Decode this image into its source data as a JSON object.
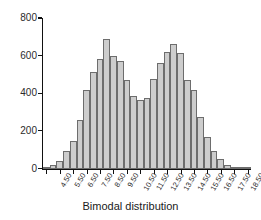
{
  "chart_data": {
    "type": "bar",
    "title": "",
    "xlabel": "Bimodal distribution",
    "ylabel": "",
    "grid": false,
    "legend": null,
    "ylim": [
      0,
      800
    ],
    "yticks": [
      0,
      200,
      400,
      600,
      800
    ],
    "ytick_labels": [
      "0",
      "200",
      "400",
      "600",
      "800"
    ],
    "categories": [
      "4.50",
      "5.00",
      "5.50",
      "6.00",
      "6.50",
      "7.00",
      "7.50",
      "8.00",
      "8.50",
      "9.00",
      "9.50",
      "10.00",
      "10.50",
      "11.00",
      "11.50",
      "12.00",
      "12.50",
      "13.00",
      "13.50",
      "14.00",
      "14.50",
      "15.00",
      "15.50",
      "16.00",
      "16.50",
      "17.00",
      "17.50",
      "18.00",
      "18.50",
      "19.00",
      "19.50"
    ],
    "xtick_labels": [
      "4.50",
      "5.50",
      "6.50",
      "7.50",
      "8.50",
      "9.50",
      "10.50",
      "11.50",
      "12.50",
      "13.50",
      "14.50",
      "15.50",
      "16.50",
      "17.50",
      "18.50",
      "19.50"
    ],
    "values": [
      5,
      18,
      40,
      95,
      148,
      260,
      418,
      515,
      580,
      690,
      597,
      572,
      472,
      388,
      362,
      375,
      478,
      562,
      620,
      660,
      612,
      472,
      420,
      275,
      170,
      95,
      48,
      18,
      8,
      4,
      2
    ]
  },
  "axis": {
    "y_axis_name": "count-axis",
    "x_axis_name": "bin-axis"
  },
  "style": {
    "bar_fill": "#cdcdcd",
    "bar_stroke": "#6d6d6d",
    "axis_color": "#111111",
    "text_color": "#2b2b2b",
    "background": "#ffffff"
  }
}
